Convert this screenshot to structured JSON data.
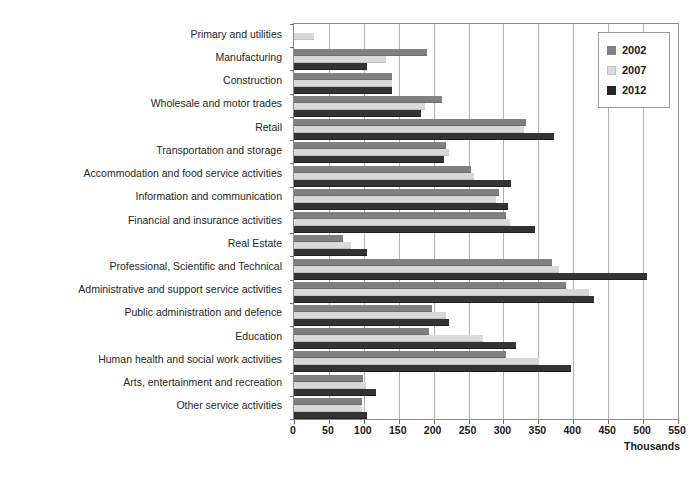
{
  "title_cutoff": "",
  "axis": {
    "x_title": "Thousands",
    "x_min": 0,
    "x_max": 550,
    "x_step": 50,
    "ticks": [
      "0",
      "50",
      "100",
      "150",
      "200",
      "250",
      "300",
      "350",
      "400",
      "450",
      "500",
      "550"
    ]
  },
  "legend": {
    "position": "top-right",
    "items": [
      {
        "label": "2002",
        "color": "#808080",
        "key": "y2002"
      },
      {
        "label": "2007",
        "color": "#d9d9d9",
        "key": "y2007"
      },
      {
        "label": "2012",
        "color": "#262626",
        "key": "y2012"
      }
    ]
  },
  "chart_data": {
    "type": "bar",
    "orientation": "horizontal",
    "title": "",
    "xlabel": "Thousands",
    "ylabel": "",
    "xlim": [
      0,
      550
    ],
    "grid": true,
    "legend_position": "top-right",
    "categories": [
      "Primary and utilities",
      "Manufacturing",
      "Construction",
      "Wholesale and motor trades",
      "Retail",
      "Transportation and storage",
      "Accommodation and food service activities",
      "Information and communication",
      "Financial and insurance activities",
      "Real Estate",
      "Professional, Scientific and Technical",
      "Administrative and support service activities",
      "Public administration and defence",
      "Education",
      "Human health and social work activities",
      "Arts, entertainment and recreation",
      "Other service activities"
    ],
    "series": [
      {
        "name": "2002",
        "color": "#808080",
        "values": [
          null,
          190,
          140,
          212,
          333,
          218,
          254,
          293,
          303,
          70,
          369,
          390,
          198,
          193,
          304,
          99,
          98
        ]
      },
      {
        "name": "2007",
        "color": "#d9d9d9",
        "values": [
          28,
          132,
          140,
          187,
          330,
          222,
          258,
          290,
          310,
          82,
          379,
          423,
          218,
          271,
          351,
          103,
          98
        ]
      },
      {
        "name": "2012",
        "color": "#262626",
        "values": [
          null,
          105,
          140,
          182,
          372,
          215,
          311,
          307,
          345,
          105,
          505,
          430,
          222,
          318,
          397,
          118,
          105
        ]
      }
    ]
  }
}
